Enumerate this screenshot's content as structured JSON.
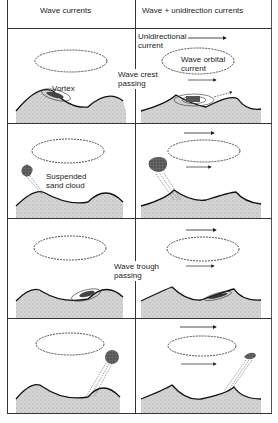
{
  "header": {
    "left_column": "Wave currents",
    "right_column": "Wave + unidirection currents"
  },
  "labels": {
    "unidirectional_current": [
      "Unidirectional",
      "current"
    ],
    "wave_orbital_current": [
      "Wave orbital",
      "current"
    ],
    "wave_crest_passing": [
      "Wave crest",
      "passing"
    ],
    "vortex": "Vortex",
    "suspended_sand_cloud": [
      "Suspended",
      "sand cloud"
    ],
    "wave_trough_passing": [
      "Wave trough",
      "passing"
    ]
  },
  "rows": [
    {
      "phase": "wave crest passing - vortex forms on lee side"
    },
    {
      "phase": "sand cloud ejected"
    },
    {
      "phase": "wave trough passing - vortex forms on opposite side"
    },
    {
      "phase": "sand cloud ejected opposite direction"
    }
  ],
  "colors": {
    "line": "#222222",
    "sand": "#c8c8c8",
    "cloud": "#555555"
  }
}
